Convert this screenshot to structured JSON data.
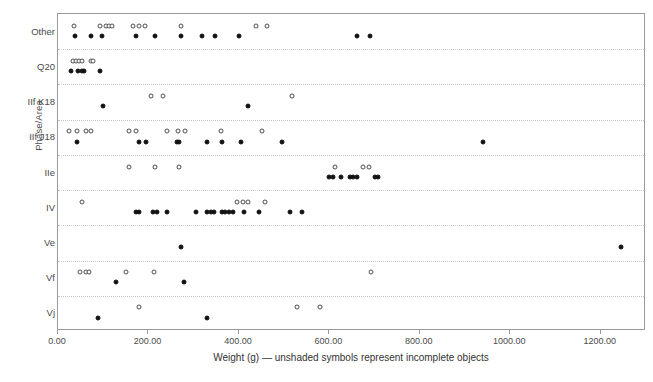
{
  "chart_data": {
    "type": "scatter",
    "title": "",
    "xlabel": "Weight (g) — unshaded symbols represent incomplete objects",
    "ylabel": "Phase/Area",
    "xlim": [
      0,
      1300
    ],
    "ylim_categories": [
      "Other",
      "Q20",
      "IIf K18",
      "IIf J18",
      "IIe",
      "IV",
      "Ve",
      "Vf",
      "Vj"
    ],
    "grid": true,
    "legend": "none",
    "x_ticks": [
      "0.00",
      "200.00",
      "400.00",
      "600.00",
      "800.00",
      "1000.00",
      "1200.00"
    ],
    "x_tick_values": [
      0,
      200,
      400,
      600,
      800,
      1000,
      1200
    ],
    "y_ticks": [
      "Other",
      "Q20",
      "IIf K18",
      "IIf J18",
      "IIe",
      "IV",
      "Ve",
      "Vf",
      "Vj"
    ],
    "series": [
      {
        "name": "incomplete objects",
        "marker": "open-circle",
        "points": [
          {
            "category": "Other",
            "x": 35
          },
          {
            "category": "Other",
            "x": 92
          },
          {
            "category": "Other",
            "x": 106
          },
          {
            "category": "Other",
            "x": 113
          },
          {
            "category": "Other",
            "x": 120
          },
          {
            "category": "Other",
            "x": 165
          },
          {
            "category": "Other",
            "x": 178
          },
          {
            "category": "Other",
            "x": 192
          },
          {
            "category": "Other",
            "x": 272
          },
          {
            "category": "Other",
            "x": 438
          },
          {
            "category": "Other",
            "x": 462
          },
          {
            "category": "Q20",
            "x": 33
          },
          {
            "category": "Q20",
            "x": 40
          },
          {
            "category": "Q20",
            "x": 47
          },
          {
            "category": "Q20",
            "x": 53
          },
          {
            "category": "Q20",
            "x": 72
          },
          {
            "category": "Q20",
            "x": 78
          },
          {
            "category": "IIf K18",
            "x": 205
          },
          {
            "category": "IIf K18",
            "x": 232
          },
          {
            "category": "IIf K18",
            "x": 518
          },
          {
            "category": "IIf J18",
            "x": 24
          },
          {
            "category": "IIf J18",
            "x": 42
          },
          {
            "category": "IIf J18",
            "x": 62
          },
          {
            "category": "IIf J18",
            "x": 74
          },
          {
            "category": "IIf J18",
            "x": 158
          },
          {
            "category": "IIf J18",
            "x": 172
          },
          {
            "category": "IIf J18",
            "x": 242
          },
          {
            "category": "IIf J18",
            "x": 266
          },
          {
            "category": "IIf J18",
            "x": 280
          },
          {
            "category": "IIf J18",
            "x": 360
          },
          {
            "category": "IIf J18",
            "x": 452
          },
          {
            "category": "IIe",
            "x": 158
          },
          {
            "category": "IIe",
            "x": 215
          },
          {
            "category": "IIe",
            "x": 268
          },
          {
            "category": "IIe",
            "x": 612
          },
          {
            "category": "IIe",
            "x": 675
          },
          {
            "category": "IIe",
            "x": 688
          },
          {
            "category": "IV",
            "x": 52
          },
          {
            "category": "IV",
            "x": 395
          },
          {
            "category": "IV",
            "x": 408
          },
          {
            "category": "IV",
            "x": 420
          },
          {
            "category": "IV",
            "x": 458
          },
          {
            "category": "Vf",
            "x": 48
          },
          {
            "category": "Vf",
            "x": 62
          },
          {
            "category": "Vf",
            "x": 68
          },
          {
            "category": "Vf",
            "x": 150
          },
          {
            "category": "Vf",
            "x": 212
          },
          {
            "category": "Vf",
            "x": 692
          },
          {
            "category": "Vj",
            "x": 180
          },
          {
            "category": "Vj",
            "x": 528
          },
          {
            "category": "Vj",
            "x": 580
          }
        ]
      },
      {
        "name": "complete objects",
        "marker": "filled-circle",
        "points": [
          {
            "category": "Other",
            "x": 38
          },
          {
            "category": "Other",
            "x": 72
          },
          {
            "category": "Other",
            "x": 98
          },
          {
            "category": "Other",
            "x": 172
          },
          {
            "category": "Other",
            "x": 215
          },
          {
            "category": "Other",
            "x": 272
          },
          {
            "category": "Other",
            "x": 318
          },
          {
            "category": "Other",
            "x": 348
          },
          {
            "category": "Other",
            "x": 400
          },
          {
            "category": "Other",
            "x": 660
          },
          {
            "category": "Other",
            "x": 690
          },
          {
            "category": "Q20",
            "x": 28
          },
          {
            "category": "Q20",
            "x": 45
          },
          {
            "category": "Q20",
            "x": 52
          },
          {
            "category": "Q20",
            "x": 58
          },
          {
            "category": "Q20",
            "x": 92
          },
          {
            "category": "IIf K18",
            "x": 100
          },
          {
            "category": "IIf K18",
            "x": 420
          },
          {
            "category": "IIf J18",
            "x": 42
          },
          {
            "category": "IIf J18",
            "x": 180
          },
          {
            "category": "IIf J18",
            "x": 195
          },
          {
            "category": "IIf J18",
            "x": 262
          },
          {
            "category": "IIf J18",
            "x": 268
          },
          {
            "category": "IIf J18",
            "x": 330
          },
          {
            "category": "IIf J18",
            "x": 362
          },
          {
            "category": "IIf J18",
            "x": 405
          },
          {
            "category": "IIf J18",
            "x": 495
          },
          {
            "category": "IIf J18",
            "x": 940
          },
          {
            "category": "IIe",
            "x": 600
          },
          {
            "category": "IIe",
            "x": 608
          },
          {
            "category": "IIe",
            "x": 625
          },
          {
            "category": "IIe",
            "x": 645
          },
          {
            "category": "IIe",
            "x": 652
          },
          {
            "category": "IIe",
            "x": 660
          },
          {
            "category": "IIe",
            "x": 700
          },
          {
            "category": "IIe",
            "x": 708
          },
          {
            "category": "IV",
            "x": 172
          },
          {
            "category": "IV",
            "x": 180
          },
          {
            "category": "IV",
            "x": 210
          },
          {
            "category": "IV",
            "x": 218
          },
          {
            "category": "IV",
            "x": 240
          },
          {
            "category": "IV",
            "x": 305
          },
          {
            "category": "IV",
            "x": 330
          },
          {
            "category": "IV",
            "x": 338
          },
          {
            "category": "IV",
            "x": 345
          },
          {
            "category": "IV",
            "x": 362
          },
          {
            "category": "IV",
            "x": 370
          },
          {
            "category": "IV",
            "x": 378
          },
          {
            "category": "IV",
            "x": 388
          },
          {
            "category": "IV",
            "x": 412
          },
          {
            "category": "IV",
            "x": 445
          },
          {
            "category": "IV",
            "x": 512
          },
          {
            "category": "IV",
            "x": 540
          },
          {
            "category": "Ve",
            "x": 272
          },
          {
            "category": "Ve",
            "x": 1245
          },
          {
            "category": "Vf",
            "x": 128
          },
          {
            "category": "Vf",
            "x": 278
          },
          {
            "category": "Vj",
            "x": 88
          },
          {
            "category": "Vj",
            "x": 330
          }
        ]
      }
    ]
  },
  "axes": {
    "y_title": "Phase/Area",
    "x_title": "Weight (g) — unshaded symbols represent incomplete objects"
  },
  "caption": ""
}
